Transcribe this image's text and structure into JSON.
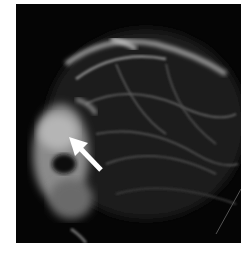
{
  "image": {
    "description": "Grayscale radiographic (mammogram-like) image of breast tissue on black background with a white arrow pointing to a dense region on the left",
    "background_color": "#050505",
    "tissue_color": "#d8d8d8",
    "annotation": {
      "type": "arrow",
      "color": "#ffffff",
      "label": ""
    }
  }
}
